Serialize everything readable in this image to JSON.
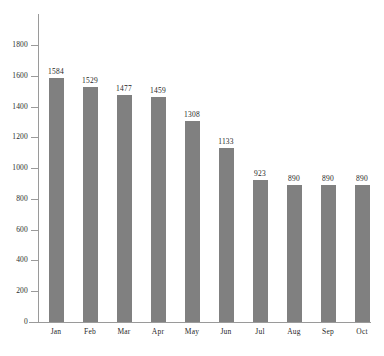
{
  "chart_data": {
    "type": "bar",
    "title": "",
    "subtitle": "",
    "xlabel": "",
    "ylabel": "",
    "categories": [
      "Jan",
      "Feb",
      "Mar",
      "Apr",
      "May",
      "Jun",
      "Jul",
      "Aug",
      "Sep",
      "Oct"
    ],
    "values": [
      1584,
      1529,
      1477,
      1459,
      1308,
      1133,
      923,
      890,
      890,
      890
    ],
    "data_labels": [
      "1584",
      "1529",
      "1477",
      "1459",
      "1308",
      "1133",
      "923",
      "890",
      "890",
      "890"
    ],
    "ylim": [
      0,
      1800
    ],
    "ytick_values": [
      0,
      200,
      400,
      600,
      800,
      1000,
      1200,
      1400,
      1600,
      1800
    ],
    "ytick_labels": [
      "0",
      "200",
      "400",
      "600",
      "800",
      "1000",
      "1200",
      "1400",
      "1600",
      "1800"
    ],
    "grid": false,
    "legend": null,
    "legend_position": "none",
    "bar_color": "#808080",
    "axis_color": "#9a9a9a",
    "text_color": "#1f1f1f",
    "background_color": "#ffffff"
  }
}
